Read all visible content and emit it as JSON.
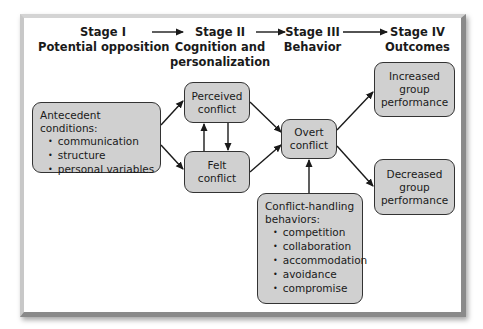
{
  "diagram": {
    "stages": [
      {
        "id": "stage-1",
        "title": "Stage I",
        "subtitle_lines": [
          "Potential opposition"
        ]
      },
      {
        "id": "stage-2",
        "title": "Stage II",
        "subtitle_lines": [
          "Cognition and",
          "personalization"
        ]
      },
      {
        "id": "stage-3",
        "title": "Stage III",
        "subtitle_lines": [
          "Behavior"
        ]
      },
      {
        "id": "stage-4",
        "title": "Stage IV",
        "subtitle_lines": [
          "Outcomes"
        ]
      }
    ],
    "nodes": {
      "antecedent": {
        "heading": "Antecedent conditions:",
        "items": [
          "communication",
          "structure",
          "personal variables"
        ]
      },
      "perceived": {
        "lines": [
          "Perceived",
          "conflict"
        ]
      },
      "felt": {
        "lines": [
          "Felt",
          "conflict"
        ]
      },
      "overt": {
        "lines": [
          "Overt",
          "conflict"
        ]
      },
      "increased": {
        "lines": [
          "Increased",
          "group",
          "performance"
        ]
      },
      "decreased": {
        "lines": [
          "Decreased",
          "group",
          "performance"
        ]
      },
      "conflict_handling": {
        "heading_lines": [
          "Conflict-handling",
          "behaviors:"
        ],
        "items": [
          "competition",
          "collaboration",
          "accommodation",
          "avoidance",
          "compromise"
        ]
      }
    },
    "edges": [
      {
        "from": "stage-1",
        "to": "stage-2"
      },
      {
        "from": "stage-2",
        "to": "stage-3"
      },
      {
        "from": "stage-3",
        "to": "stage-4"
      },
      {
        "from": "antecedent",
        "to": "perceived"
      },
      {
        "from": "antecedent",
        "to": "felt"
      },
      {
        "from": "perceived",
        "to": "felt"
      },
      {
        "from": "felt",
        "to": "perceived"
      },
      {
        "from": "perceived",
        "to": "overt"
      },
      {
        "from": "felt",
        "to": "overt"
      },
      {
        "from": "conflict_handling",
        "to": "overt"
      },
      {
        "from": "overt",
        "to": "increased"
      },
      {
        "from": "overt",
        "to": "decreased"
      }
    ],
    "colors": {
      "node_fill": "#d0d0d0",
      "node_border": "#333333",
      "arrow": "#1a1a1a",
      "background": "#ffffff"
    }
  }
}
